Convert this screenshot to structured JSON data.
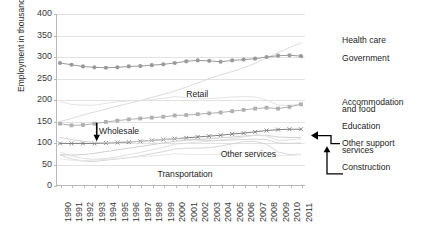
{
  "chart_data": {
    "type": "line",
    "title": "",
    "xlabel": "",
    "ylabel": "Employment in thousands",
    "ylim": [
      0,
      400
    ],
    "yticks": [
      400,
      350,
      300,
      250,
      200,
      150,
      100,
      50,
      0
    ],
    "grid": true,
    "legend_position": "right-inline",
    "x": [
      1990,
      1991,
      1992,
      1993,
      1994,
      1995,
      1996,
      1997,
      1998,
      1999,
      2000,
      2001,
      2002,
      2003,
      2004,
      2005,
      2006,
      2007,
      2008,
      2009,
      2010,
      2011
    ],
    "categories": [
      "1990",
      "1991",
      "1992",
      "1993",
      "1994",
      "1995",
      "1996",
      "1997",
      "1998",
      "1999",
      "2000",
      "2001",
      "2002",
      "2003",
      "2004",
      "2005",
      "2006",
      "2007",
      "2008",
      "2009",
      "2010",
      "2011"
    ],
    "series": [
      {
        "name": "Health care",
        "label_position": "right",
        "color": "#d7d7d7",
        "marker": "none",
        "values": [
          150,
          157,
          165,
          172,
          179,
          186,
          192,
          199,
          206,
          213,
          221,
          230,
          240,
          250,
          258,
          266,
          275,
          285,
          298,
          310,
          322,
          333
        ]
      },
      {
        "name": "Government",
        "label_position": "right",
        "color": "#9a9a9a",
        "marker": "circle",
        "values": [
          286,
          282,
          278,
          276,
          275,
          276,
          278,
          279,
          281,
          283,
          286,
          290,
          292,
          291,
          289,
          292,
          294,
          296,
          300,
          303,
          304,
          302
        ]
      },
      {
        "name": "Retail",
        "label_position": "inline",
        "color": "#e0e0e0",
        "marker": "none",
        "values": [
          196,
          190,
          188,
          188,
          192,
          196,
          198,
          199,
          201,
          204,
          208,
          206,
          204,
          203,
          205,
          207,
          208,
          207,
          200,
          188,
          188,
          191
        ]
      },
      {
        "name": "Accommodation and food",
        "label_position": "right",
        "color": "#b0b0b0",
        "marker": "square",
        "values": [
          145,
          141,
          142,
          145,
          149,
          152,
          155,
          157,
          159,
          161,
          164,
          165,
          167,
          169,
          171,
          174,
          177,
          180,
          182,
          180,
          184,
          190
        ]
      },
      {
        "name": "Education",
        "label_position": "right",
        "color": "#7f7f7f",
        "marker": "cross",
        "values": [
          99,
          99,
          99,
          99,
          100,
          101,
          102,
          104,
          106,
          108,
          110,
          112,
          114,
          116,
          118,
          121,
          123,
          126,
          129,
          131,
          132,
          132
        ]
      },
      {
        "name": "Wholesale",
        "label_position": "inline",
        "color": "#cfcfcf",
        "marker": "none",
        "values": [
          113,
          108,
          104,
          101,
          101,
          102,
          103,
          104,
          106,
          108,
          110,
          109,
          107,
          106,
          106,
          107,
          108,
          109,
          108,
          100,
          99,
          100
        ]
      },
      {
        "name": "Other services",
        "label_position": "inline",
        "color": "#c9c9c9",
        "marker": "none",
        "values": [
          73,
          72,
          73,
          76,
          80,
          84,
          88,
          92,
          96,
          100,
          104,
          106,
          108,
          110,
          112,
          114,
          116,
          118,
          118,
          114,
          113,
          113
        ]
      },
      {
        "name": "Other support services",
        "label_position": "right-arrow",
        "color": "#dcdcdc",
        "marker": "none",
        "values": [
          79,
          70,
          64,
          62,
          64,
          68,
          73,
          78,
          84,
          90,
          97,
          100,
          102,
          104,
          107,
          110,
          114,
          118,
          116,
          106,
          107,
          110
        ]
      },
      {
        "name": "Construction",
        "label_position": "right-arrow",
        "color": "#d2d2d2",
        "marker": "none",
        "values": [
          72,
          63,
          58,
          57,
          60,
          63,
          66,
          70,
          75,
          80,
          86,
          88,
          88,
          89,
          93,
          98,
          103,
          104,
          97,
          79,
          73,
          74
        ]
      },
      {
        "name": "Transportation",
        "label_position": "inline",
        "color": "#e4e4e4",
        "marker": "none",
        "values": [
          63,
          60,
          59,
          60,
          62,
          64,
          66,
          68,
          70,
          72,
          75,
          74,
          73,
          73,
          74,
          76,
          78,
          79,
          78,
          71,
          71,
          73
        ]
      }
    ],
    "right_labels": [
      {
        "text": "Health care",
        "y_value": 340
      },
      {
        "text": "Government",
        "y_value": 297
      },
      {
        "text": "Accommodation",
        "y_value": 196
      },
      {
        "text": "and food",
        "y_value": 178
      },
      {
        "text": "Education",
        "y_value": 140
      },
      {
        "text": "Other support",
        "y_value": 100
      },
      {
        "text": "services",
        "y_value": 84
      },
      {
        "text": "Construction",
        "y_value": 44
      }
    ],
    "inline_labels": [
      {
        "text": "Retail",
        "x_value": 2001.0,
        "y_value": 213
      },
      {
        "text": "Wholesale",
        "x_value": 1993.4,
        "y_value": 127
      },
      {
        "text": "Other services",
        "x_value": 2004.0,
        "y_value": 75
      },
      {
        "text": "Transportation",
        "x_value": 1998.5,
        "y_value": 27
      }
    ],
    "annotations": [
      {
        "type": "arrow-down",
        "label": "Wholesale",
        "target_x_value": 1993.2,
        "target_y_value": 101
      },
      {
        "type": "arrow-left",
        "label": "Other support services",
        "target_x_value": 2011,
        "target_y_value": 110
      },
      {
        "type": "arrow-up",
        "label": "Construction",
        "target_x_value": 2009.6,
        "target_y_value": 80
      }
    ]
  },
  "axis": {
    "y_title": "Employment in thousands"
  }
}
